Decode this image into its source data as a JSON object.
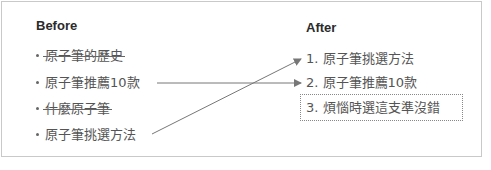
{
  "before": {
    "heading": "Before",
    "items": [
      {
        "text": "原子筆的歷史",
        "struck": true
      },
      {
        "text": "原子筆推薦10款",
        "struck": false
      },
      {
        "text": "什麼原子筆",
        "struck": true
      },
      {
        "text": "原子筆挑選方法",
        "struck": false
      }
    ]
  },
  "after": {
    "heading": "After",
    "items": [
      {
        "text": "1. 原子筆挑選方法",
        "highlighted": false
      },
      {
        "text": "2. 原子筆推薦10款",
        "highlighted": false
      },
      {
        "text": "3. 煩惱時選這支準沒錯",
        "highlighted": true
      }
    ]
  },
  "connections": [
    {
      "from": "原子筆推薦10款",
      "to": "2. 原子筆推薦10款"
    },
    {
      "from": "原子筆挑選方法",
      "to": "1. 原子筆挑選方法"
    }
  ],
  "colors": {
    "arrow": "#777777",
    "border": "#c9c9c9",
    "text": "#555555",
    "heading": "#2b2b2b"
  }
}
